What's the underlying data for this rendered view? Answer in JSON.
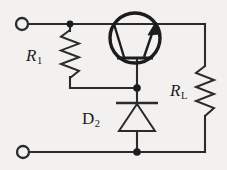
{
  "figure": {
    "kind": "electronic-schematic",
    "width": 227,
    "height": 170,
    "background_color": "#f2f1ef",
    "ink_color": "#1c1c1c"
  },
  "labels": {
    "r1": {
      "symbol": "R",
      "subscript": "1"
    },
    "rl": {
      "symbol": "R",
      "subscript": "L"
    },
    "d2": {
      "symbol": "D",
      "subscript": "2"
    }
  },
  "components": [
    {
      "id": "r1",
      "type": "resistor",
      "name": "R1",
      "orientation": "vertical",
      "position": {
        "x": 70,
        "y_top": 30,
        "y_bottom": 78
      }
    },
    {
      "id": "rl",
      "type": "resistor",
      "name": "RL",
      "role": "load",
      "orientation": "vertical",
      "position": {
        "x": 205,
        "y_top": 66,
        "y_bottom": 116
      }
    },
    {
      "id": "d2",
      "type": "diode",
      "name": "D2",
      "orientation": "vertical",
      "cathode": "top",
      "anode": "bottom",
      "position": {
        "x": 137,
        "y_top": 103,
        "y_bottom": 132
      }
    },
    {
      "id": "q1",
      "type": "transistor-bjt",
      "polarity": "npn",
      "rotation": "base-down",
      "position": {
        "cx": 135,
        "cy": 38,
        "r": 25
      }
    }
  ],
  "terminals": [
    {
      "id": "terminal-top-left",
      "x": 22,
      "y": 24,
      "r": 6
    },
    {
      "id": "terminal-bottom-left",
      "x": 23,
      "y": 152,
      "r": 6
    }
  ],
  "junctions": [
    {
      "id": "node-top-r1",
      "x": 70,
      "y": 24
    },
    {
      "id": "node-base",
      "x": 137,
      "y": 88
    },
    {
      "id": "node-bottom",
      "x": 137,
      "y": 152
    }
  ],
  "nets": {
    "top_rail_y": 24,
    "bottom_rail_y": 152,
    "right_rail_x": 205
  }
}
